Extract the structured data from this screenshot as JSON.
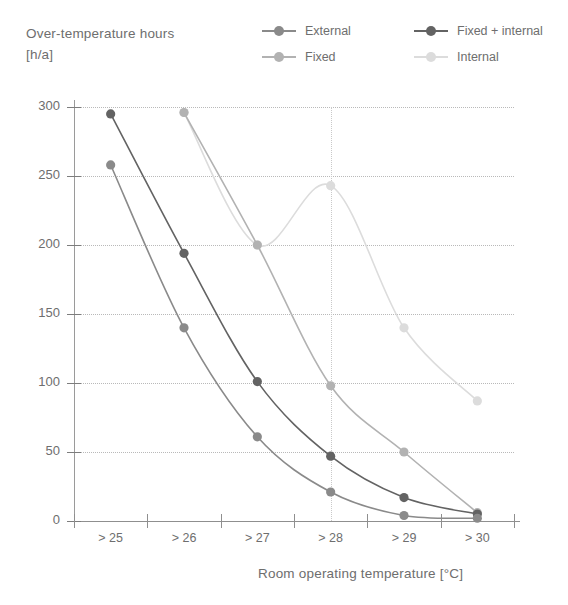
{
  "axes": {
    "y_title_line1": "Over-temperature hours",
    "y_title_line2": "[h/a]",
    "x_title": "Room operating temperature [°C]",
    "y_ticks": [
      "0",
      "50",
      "100",
      "150",
      "200",
      "250",
      "300"
    ],
    "x_ticks": [
      "> 25",
      "> 26",
      "> 27",
      "> 28",
      "> 29",
      "> 30"
    ]
  },
  "legend": {
    "items": [
      {
        "label": "External",
        "color": "#8a8a8a"
      },
      {
        "label": "Fixed + internal",
        "color": "#636363"
      },
      {
        "label": "Fixed",
        "color": "#b2b2b2"
      },
      {
        "label": "Internal",
        "color": "#dcdcdc"
      }
    ]
  },
  "chart_data": {
    "type": "line",
    "title": "Over-temperature hours [h/a]",
    "xlabel": "Room operating temperature [°C]",
    "ylabel": "Over-temperature hours [h/a]",
    "categories": [
      "> 25",
      "> 26",
      "> 27",
      "> 28",
      "> 29",
      "> 30"
    ],
    "ylim": [
      0,
      300
    ],
    "yticks": [
      0,
      50,
      100,
      150,
      200,
      250,
      300
    ],
    "grid": "horizontal-dotted",
    "legend_position": "top-right",
    "series": [
      {
        "name": "Internal",
        "color": "#dcdcdc",
        "values": [
          null,
          296,
          200,
          243,
          140,
          87
        ]
      },
      {
        "name": "Fixed",
        "color": "#b2b2b2",
        "values": [
          null,
          296,
          200,
          98,
          50,
          6
        ]
      },
      {
        "name": "Fixed + internal",
        "color": "#636363",
        "values": [
          295,
          194,
          101,
          47,
          17,
          5
        ]
      },
      {
        "name": "External",
        "color": "#8a8a8a",
        "values": [
          258,
          140,
          61,
          21,
          4,
          2
        ]
      }
    ]
  }
}
